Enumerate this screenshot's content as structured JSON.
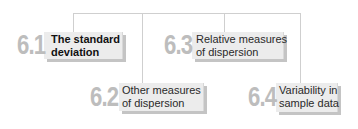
{
  "diagram": {
    "colors": {
      "connector": "#cfcfcf",
      "box_fill": "#ececec",
      "box_shadow": "#c4c4c4",
      "number": "#bdbdbd",
      "label": "#2a2a2a"
    },
    "nodes": [
      {
        "number": "6.1",
        "label_line1": "The standard",
        "label_line2": "deviation",
        "emphasized": true
      },
      {
        "number": "6.2",
        "label_line1": "Other measures",
        "label_line2": "of dispersion",
        "emphasized": false
      },
      {
        "number": "6.3",
        "label_line1": "Relative measures",
        "label_line2": "of dispersion",
        "emphasized": false
      },
      {
        "number": "6.4",
        "label_line1": "Variability in",
        "label_line2": "sample data",
        "emphasized": false
      }
    ]
  }
}
